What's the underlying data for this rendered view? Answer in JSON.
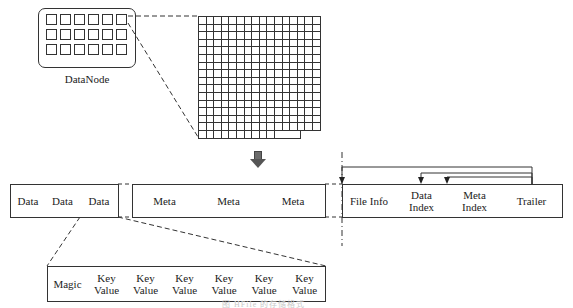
{
  "datanode": {
    "label": "DataNode",
    "block_rows": 3,
    "block_cols": 6
  },
  "hdfs_block_grid": {
    "rows": 16,
    "cols": 16,
    "last_row_filled_cols": 10
  },
  "arrow": {
    "icon": "down-arrow-icon",
    "color": "#666666"
  },
  "hfile": {
    "data_section": [
      {
        "label": "Data"
      },
      {
        "label": "Data"
      },
      {
        "label": "Data"
      }
    ],
    "meta_section": [
      {
        "label": "Meta"
      },
      {
        "label": "Meta"
      },
      {
        "label": "Meta"
      }
    ],
    "trailer_section": [
      {
        "label": "File Info"
      },
      {
        "label": "Data Index",
        "line1": "Data",
        "line2": "Index"
      },
      {
        "label": "Meta Index",
        "line1": "Meta",
        "line2": "Index"
      },
      {
        "label": "Trailer"
      }
    ]
  },
  "data_block": {
    "cells": [
      {
        "label": "Magic"
      },
      {
        "line1": "Key",
        "line2": "Value"
      },
      {
        "line1": "Key",
        "line2": "Value"
      },
      {
        "line1": "Key",
        "line2": "Value"
      },
      {
        "line1": "Key",
        "line2": "Value"
      },
      {
        "line1": "Key",
        "line2": "Value"
      },
      {
        "line1": "Key",
        "line2": "Value"
      }
    ]
  },
  "caption": "图 HFile 的存储格式"
}
